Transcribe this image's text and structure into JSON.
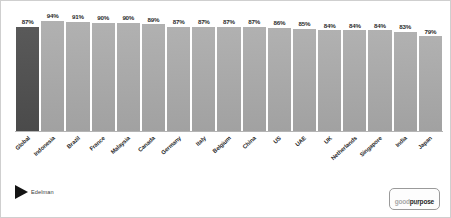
{
  "chart_data": {
    "type": "bar",
    "title": "",
    "subtitle": "",
    "xlabel": "",
    "ylabel": "",
    "ylim": [
      0,
      100
    ],
    "grid": false,
    "legend": "none",
    "categories": [
      "Global",
      "Indonesia",
      "Brazil",
      "France",
      "Malaysia",
      "Canada",
      "Germany",
      "Italy",
      "Belgium",
      "China",
      "US",
      "UAE",
      "UK",
      "Netherlands",
      "Singapore",
      "India",
      "Japan"
    ],
    "values": [
      87,
      94,
      91,
      90,
      90,
      89,
      87,
      87,
      87,
      87,
      86,
      85,
      84,
      84,
      84,
      83,
      79
    ],
    "value_labels": [
      "87%",
      "94%",
      "91%",
      "90%",
      "90%",
      "89%",
      "87%",
      "87%",
      "87%",
      "87%",
      "86%",
      "85%",
      "84%",
      "84%",
      "84%",
      "83%",
      "79%"
    ],
    "highlight_index": 0,
    "bar_color": "#a8a8a8",
    "highlight_color": "#4f4f4f"
  },
  "footer": {
    "edelman_label": "Edelman",
    "goodpurpose_good": "good",
    "goodpurpose_purpose": "purpose",
    "goodpurpose_sub": "TM"
  }
}
